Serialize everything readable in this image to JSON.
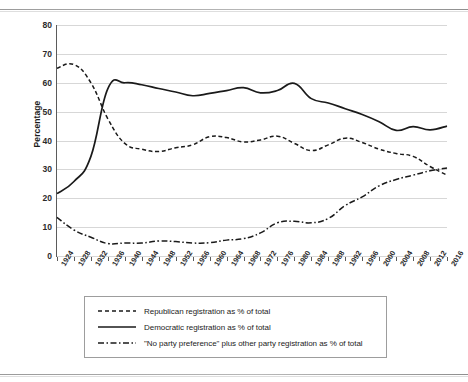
{
  "page": {
    "clipped_header_text": "",
    "background_color": "#ffffff"
  },
  "chart_data": {
    "type": "line",
    "title": "",
    "subtitle": "",
    "xlabel": "",
    "ylabel": "Percentage",
    "ylim": [
      0,
      80
    ],
    "ytick_values": [
      0,
      10,
      20,
      30,
      40,
      50,
      60,
      70,
      80
    ],
    "ytick_labels": [
      "0",
      "10",
      "20",
      "30",
      "40",
      "50",
      "60",
      "70",
      "80"
    ],
    "grid": "horizontal",
    "legend_position": "below-plot",
    "categories": [
      "1924",
      "1928",
      "1932",
      "1936",
      "1940",
      "1944",
      "1948",
      "1952",
      "1956",
      "1960",
      "1964",
      "1968",
      "1972",
      "1976",
      "1980",
      "1984",
      "1988",
      "1992",
      "1996",
      "2000",
      "2004",
      "2008",
      "2012",
      "2016"
    ],
    "x": [
      1924,
      1928,
      1932,
      1936,
      1940,
      1944,
      1948,
      1952,
      1956,
      1960,
      1964,
      1968,
      1972,
      1976,
      1980,
      1984,
      1988,
      1992,
      1996,
      2000,
      2004,
      2008,
      2012,
      2016
    ],
    "series": [
      {
        "name": "Republican registration as % of total",
        "style": "dashed",
        "color": "#1a1a1a",
        "values": [
          65.0,
          66.3,
          60.0,
          47.5,
          39.0,
          37.0,
          36.2,
          37.5,
          38.5,
          41.3,
          41.0,
          39.5,
          40.2,
          41.5,
          39.0,
          36.5,
          38.5,
          40.8,
          39.3,
          37.0,
          35.5,
          34.5,
          31.0,
          28.0
        ]
      },
      {
        "name": "Democratic registration as % of total",
        "style": "solid",
        "color": "#1a1a1a",
        "values": [
          21.6,
          25.8,
          34.5,
          58.0,
          60.0,
          59.3,
          58.0,
          56.8,
          55.5,
          56.3,
          57.3,
          58.3,
          56.5,
          57.3,
          59.8,
          54.5,
          53.0,
          51.0,
          49.0,
          46.5,
          43.5,
          44.8,
          43.7,
          45.0
        ]
      },
      {
        "name": "\"No party preference\" plus other party registration as % of total",
        "style": "dash-dot",
        "color": "#1a1a1a",
        "values": [
          13.4,
          9.0,
          6.5,
          4.3,
          4.5,
          4.5,
          5.2,
          5.0,
          4.5,
          4.6,
          5.5,
          6.0,
          8.0,
          11.5,
          12.0,
          11.5,
          13.0,
          17.5,
          20.5,
          24.3,
          26.5,
          28.0,
          29.5,
          30.5
        ]
      }
    ]
  },
  "legend": {
    "items": [
      {
        "label": "Republican registration as % of total",
        "style": "dashed"
      },
      {
        "label": "Democratic registration as % of total",
        "style": "solid"
      },
      {
        "label": "\"No party preference\" plus other party registration as % of total",
        "style": "dash-dot"
      }
    ]
  }
}
